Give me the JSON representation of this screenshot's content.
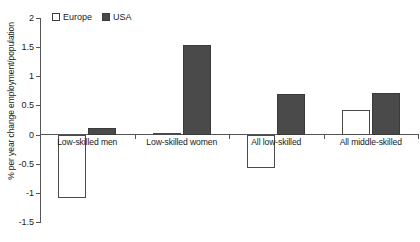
{
  "chart_data": {
    "type": "bar",
    "title": "",
    "xlabel": "",
    "ylabel": "% per year change employment/population",
    "categories": [
      "Low-skilled men",
      "Low-skilled women",
      "All low-skilled",
      "All middle-skilled"
    ],
    "series": [
      {
        "name": "Europe",
        "color": "#ffffff",
        "values": [
          -1.09,
          0.02,
          -0.57,
          0.42
        ]
      },
      {
        "name": "USA",
        "color": "#4a4a4a",
        "values": [
          0.12,
          1.53,
          0.7,
          0.71
        ]
      }
    ],
    "ylim": [
      -1.5,
      2
    ],
    "yticks": [
      2,
      1.5,
      1,
      0.5,
      0,
      -0.5,
      -1,
      -1.5
    ],
    "ytick_labels": [
      "2",
      "1.5",
      "1",
      "0.5",
      "0",
      "-0.5",
      "-1",
      "-1.5"
    ],
    "grid": false,
    "legend_position": "top-left"
  },
  "legend": {
    "entries": [
      {
        "label": "Europe",
        "marker": "open-square-marker"
      },
      {
        "label": "USA",
        "marker": "filled-square-marker"
      }
    ]
  },
  "axis": {
    "y_label": "% per year change employment/population",
    "y_tick_labels": [
      "2",
      "1.5",
      "1",
      "0.5",
      "0",
      "-0.5",
      "-1",
      "-1.5"
    ],
    "x_tick_labels": [
      "Low-skilled men",
      "Low-skilled women",
      "All low-skilled",
      "All middle-skilled"
    ]
  }
}
